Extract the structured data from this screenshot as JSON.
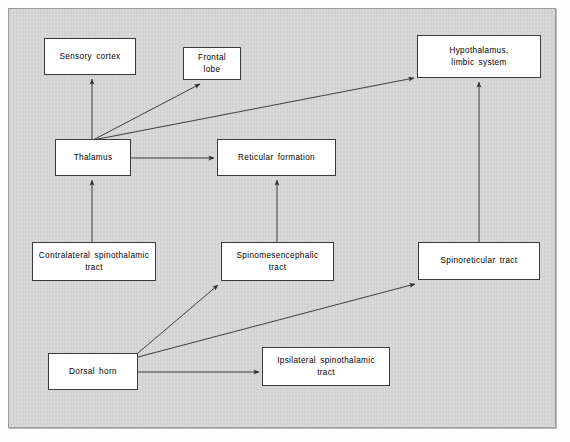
{
  "figure": {
    "kind": "flow-diagram",
    "title_visible": false,
    "panel": {
      "background_color": "#d2d2d2",
      "border_color": "#9a9a9a",
      "page_background": "#fdfdfd"
    },
    "style": {
      "node_fill": "#ffffff",
      "node_border": "#3a3a3a",
      "edge_color": "#2b2b2b",
      "text_color": "#000000"
    }
  },
  "nodes": [
    {
      "id": "sensory_cortex",
      "label": "Sensory  cortex",
      "x": 44,
      "y": 38,
      "w": 92,
      "h": 37
    },
    {
      "id": "frontal_lobe",
      "label": "Frontal  lobe",
      "x": 183,
      "y": 47,
      "w": 58,
      "h": 33
    },
    {
      "id": "hypothalamus",
      "label": "Hypothalamus,\nlimbic  system",
      "x": 417,
      "y": 35,
      "w": 124,
      "h": 43
    },
    {
      "id": "thalamus",
      "label": "Thalamus",
      "x": 55,
      "y": 139,
      "w": 76,
      "h": 37
    },
    {
      "id": "reticular",
      "label": "Reticular   formation",
      "x": 217,
      "y": 139,
      "w": 119,
      "h": 37
    },
    {
      "id": "contralateral",
      "label": "Contralateral  spinothalamic  tract",
      "x": 32,
      "y": 242,
      "w": 124,
      "h": 39
    },
    {
      "id": "spinomesenceph",
      "label": "Spinomesencephalic  tract",
      "x": 221,
      "y": 242,
      "w": 113,
      "h": 39
    },
    {
      "id": "spinoreticular",
      "label": "Spinoreticular  tract",
      "x": 418,
      "y": 242,
      "w": 122,
      "h": 38
    },
    {
      "id": "dorsal_horn",
      "label": "Dorsal  horn",
      "x": 48,
      "y": 353,
      "w": 90,
      "h": 37
    },
    {
      "id": "ipsilateral",
      "label": "Ipsilateral  spinothalamic  tract",
      "x": 262,
      "y": 347,
      "w": 128,
      "h": 39
    }
  ],
  "edges": [
    {
      "from": "thalamus",
      "to": "sensory_cortex",
      "x1": 92,
      "y1": 139,
      "x2": 92,
      "y2": 79
    },
    {
      "from": "thalamus",
      "to": "frontal_lobe",
      "x1": 93,
      "y1": 140,
      "x2": 200,
      "y2": 84
    },
    {
      "from": "thalamus",
      "to": "hypothalamus",
      "x1": 93,
      "y1": 140,
      "x2": 414,
      "y2": 78
    },
    {
      "from": "thalamus",
      "to": "reticular",
      "x1": 131,
      "y1": 158,
      "x2": 214,
      "y2": 158
    },
    {
      "from": "contralateral",
      "to": "thalamus",
      "x1": 92,
      "y1": 242,
      "x2": 92,
      "y2": 180
    },
    {
      "from": "spinomesenceph",
      "to": "reticular",
      "x1": 277,
      "y1": 242,
      "x2": 277,
      "y2": 180
    },
    {
      "from": "spinoreticular",
      "to": "hypothalamus",
      "x1": 479,
      "y1": 242,
      "x2": 479,
      "y2": 82
    },
    {
      "from": "dorsal_horn",
      "to": "spinomesenceph",
      "x1": 138,
      "y1": 353,
      "x2": 218,
      "y2": 285
    },
    {
      "from": "dorsal_horn",
      "to": "spinoreticular",
      "x1": 138,
      "y1": 357,
      "x2": 415,
      "y2": 284
    },
    {
      "from": "dorsal_horn",
      "to": "ipsilateral",
      "x1": 138,
      "y1": 372,
      "x2": 259,
      "y2": 372
    }
  ]
}
